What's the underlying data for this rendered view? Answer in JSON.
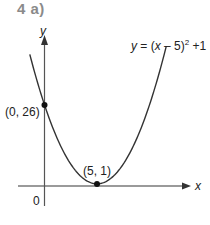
{
  "title": "4 a)",
  "chart_data": {
    "type": "line",
    "title": "4 a)",
    "xlabel": "x",
    "ylabel": "y",
    "equation": "y = (x − 5)² +1",
    "function": "(x-5)^2+1",
    "origin_label": "0",
    "grid": false,
    "points": [
      {
        "x": 0,
        "y": 26,
        "label": "(0, 26)"
      },
      {
        "x": 5,
        "y": 1,
        "label": "(5, 1)"
      }
    ],
    "x_range": [
      -1.4,
      11.6
    ],
    "y_range": [
      0,
      45
    ],
    "x": [
      -1.4,
      0,
      1,
      2,
      3,
      4,
      5,
      6,
      7,
      8,
      9,
      10,
      11,
      11.6
    ],
    "series": [
      {
        "name": "y = (x − 5)² +1",
        "values": [
          41.96,
          26,
          17,
          10,
          5,
          2,
          1,
          2,
          5,
          10,
          17,
          26,
          37,
          44.56
        ]
      }
    ],
    "colors": {
      "curve": "#333333",
      "axes": "#555555",
      "x_axis": "#999999",
      "title": "#8a8a8a"
    }
  }
}
